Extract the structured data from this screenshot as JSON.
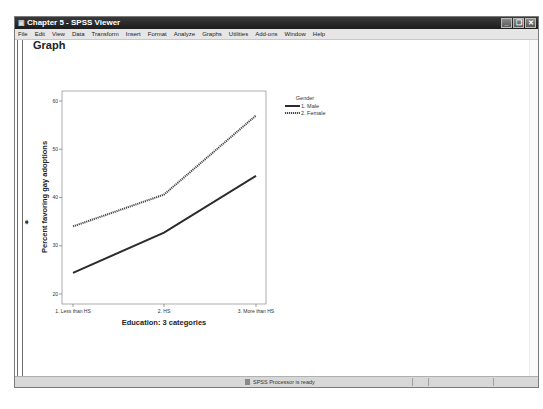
{
  "window": {
    "title": "Chapter 5 - SPSS Viewer",
    "controls": [
      "minimize",
      "restore",
      "close"
    ]
  },
  "menubar": {
    "items": [
      "File",
      "Edit",
      "View",
      "Data",
      "Transform",
      "Insert",
      "Format",
      "Analyze",
      "Graphs",
      "Utilities",
      "Add-ons",
      "Window",
      "Help"
    ]
  },
  "output": {
    "heading": "Graph",
    "marker_icon": "arrow-right-icon"
  },
  "status": {
    "text": "SPSS Processor  is ready"
  },
  "chart_data": {
    "type": "line",
    "title": "",
    "xlabel": "Education: 3 categories",
    "ylabel": "Percent favoring gay adoptions",
    "categories": [
      "1. Less than HS",
      "2. HS",
      "3. More than HS"
    ],
    "yticks": [
      20,
      30,
      40,
      50,
      60
    ],
    "ylim": [
      18,
      62
    ],
    "grid": false,
    "legend": {
      "title": "Gender",
      "position": "right"
    },
    "series": [
      {
        "name": "1. Male",
        "style": "solid",
        "color": "#2b2b2b",
        "values": [
          24.4,
          32.7,
          44.5
        ]
      },
      {
        "name": "2. Female",
        "style": "dotted",
        "color": "#4a4a4a",
        "values": [
          34.0,
          40.6,
          57.0
        ]
      }
    ]
  }
}
